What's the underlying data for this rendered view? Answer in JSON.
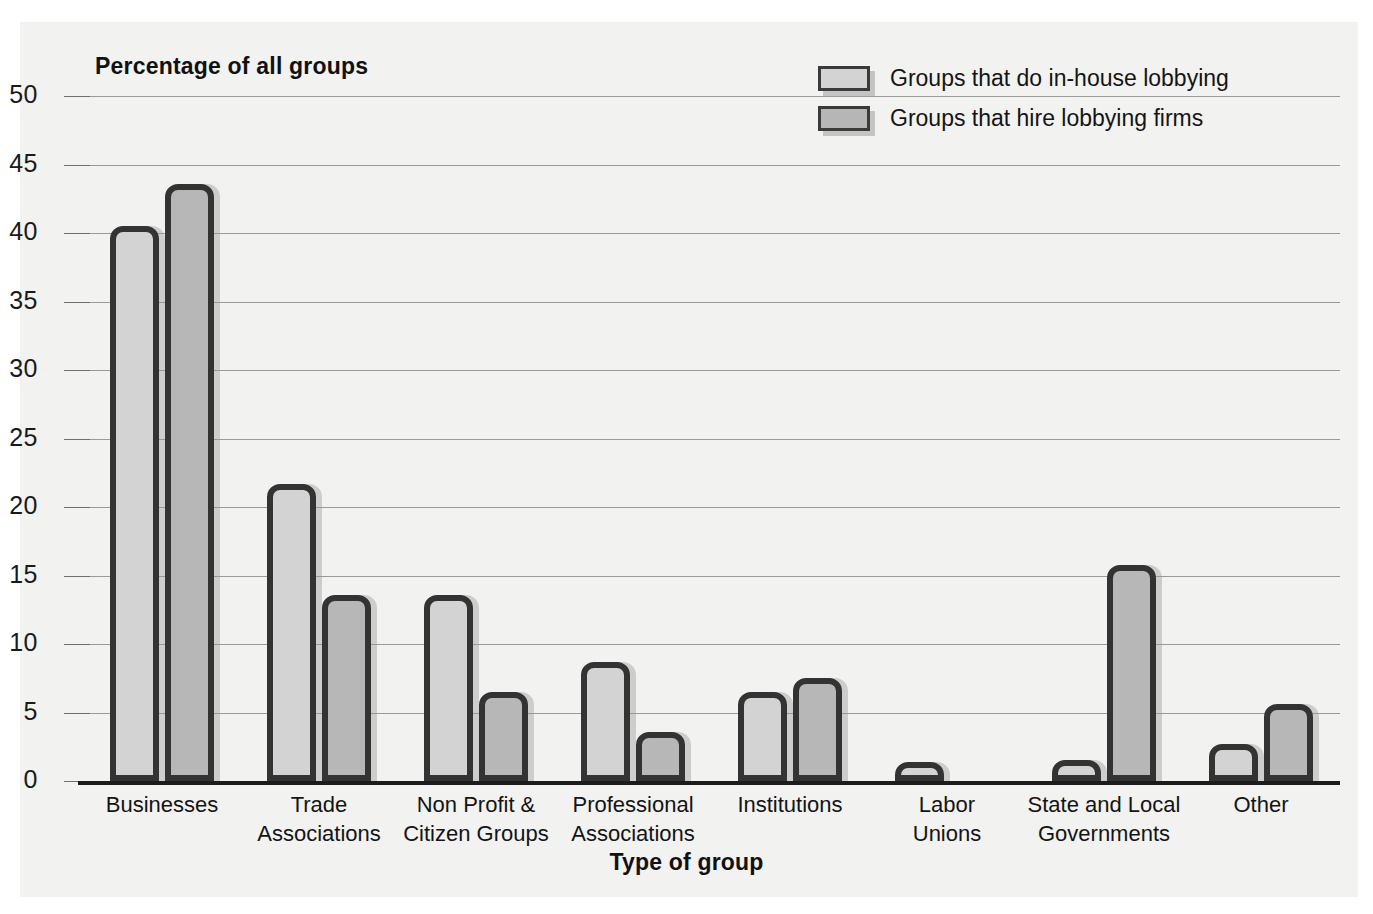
{
  "chart_data": {
    "type": "bar",
    "title": "",
    "ylabel": "Percentage of all groups",
    "xlabel": "Type of group",
    "ylim": [
      0,
      50
    ],
    "yticks": [
      0,
      5,
      10,
      15,
      20,
      25,
      30,
      35,
      40,
      45,
      50
    ],
    "grid": true,
    "legend_position": "top-right",
    "categories": [
      "Businesses",
      "Trade Associations",
      "Non Profit & Citizen Groups",
      "Professional Associations",
      "Institutions",
      "Labor Unions",
      "State and Local Governments",
      "Other"
    ],
    "category_lines": [
      [
        "Businesses"
      ],
      [
        "Trade",
        "Associations"
      ],
      [
        "Non Profit &",
        "Citizen Groups"
      ],
      [
        "Professional",
        "Associations"
      ],
      [
        "Institutions"
      ],
      [
        "Labor",
        "Unions"
      ],
      [
        "State and Local",
        "Governments"
      ],
      [
        "Other"
      ]
    ],
    "series": [
      {
        "name": "Groups that do in-house lobbying",
        "color": "#d3d3d3",
        "values": [
          40.5,
          21.7,
          13.6,
          8.7,
          6.5,
          1.4,
          1.5,
          2.7
        ]
      },
      {
        "name": "Groups that hire lobbying firms",
        "color": "#b7b7b7",
        "values": [
          43.6,
          13.6,
          6.5,
          3.6,
          7.5,
          0,
          15.8,
          5.6
        ]
      }
    ]
  },
  "colors": {
    "bar_outline": "#333333",
    "gridline": "#9a9a98",
    "axis": "#1c1c1c",
    "background": "#f2f2f0",
    "text": "#141414"
  }
}
